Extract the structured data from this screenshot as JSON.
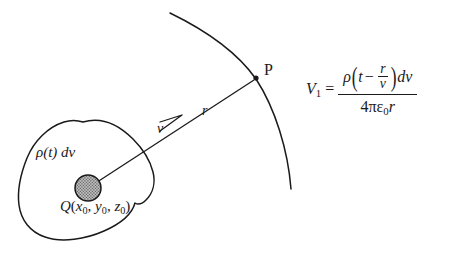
{
  "figure": {
    "name": "retarded-potential-diagram",
    "background_color": "#ffffff",
    "ink_color": "#1a1a1a",
    "charge_fill_color": "#a8a8a8",
    "labels": {
      "charge_density_element": "ρ(t) dv",
      "source_point_symbol": "Q",
      "source_point_open": "(",
      "source_point_x": "x",
      "source_point_x_sub": "0",
      "source_point_sep1": ", ",
      "source_point_y": "y",
      "source_point_y_sub": "0",
      "source_point_sep2": ", ",
      "source_point_z": "z",
      "source_point_z_sub": "0",
      "source_point_close": ")",
      "velocity": "v",
      "distance": "r",
      "field_point": "P"
    }
  },
  "equation": {
    "lhs_symbol": "V",
    "lhs_subscript": "1",
    "equals": "=",
    "numerator": {
      "rho": "ρ",
      "open_paren": "(",
      "t": "t",
      "minus": "−",
      "frac_num": "r",
      "frac_den": "v",
      "close_paren": ")",
      "dv": "dv"
    },
    "denominator": {
      "four": "4",
      "pi": "π",
      "epsilon": "ε",
      "epsilon_sub": "0",
      "r": "r"
    }
  }
}
